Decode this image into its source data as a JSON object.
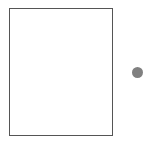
{
  "shapes": {
    "rectangle": {
      "stroke": "#555555",
      "fill": "#ffffff"
    },
    "circle": {
      "fill": "#808080"
    }
  }
}
